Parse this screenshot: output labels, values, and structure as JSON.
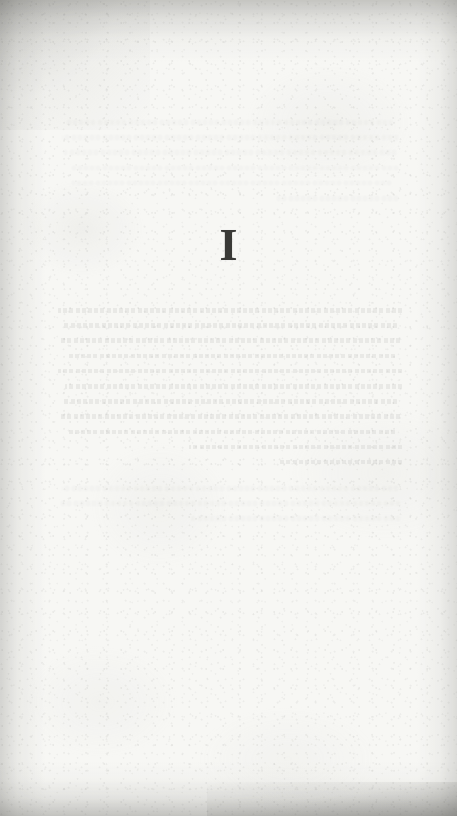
{
  "document": {
    "kind": "scanned-book-page",
    "page_type": "part-divider",
    "page_width": 457,
    "page_height": 816
  },
  "page": {
    "numeral": "I",
    "numeral_color": "#191917",
    "paper_color": "#f6f6f4",
    "edge_shadow_color": "#9a9a98"
  },
  "bleedthrough": {
    "visible": true,
    "description": "faint mirrored text showing through from the reverse side of the leaf",
    "line_count": 11,
    "lines": [
      {
        "width_class": "w-a"
      },
      {
        "width_class": "w-b"
      },
      {
        "width_class": "w-c"
      },
      {
        "width_class": "w-d"
      },
      {
        "width_class": "w-a"
      },
      {
        "width_class": "w-e"
      },
      {
        "width_class": "w-b"
      },
      {
        "width_class": "w-c"
      },
      {
        "width_class": "w-d"
      },
      {
        "width_class": "w-f"
      },
      {
        "width_class": "w-g"
      }
    ],
    "faint_top_lines": [
      {
        "width_class": "w-b"
      },
      {
        "width_class": "w-a"
      },
      {
        "width_class": "w-c"
      },
      {
        "width_class": "w-e"
      },
      {
        "width_class": "w-d"
      },
      {
        "width_class": "w-g"
      }
    ],
    "faint_bottom_lines": [
      {
        "width_class": "w-c"
      },
      {
        "width_class": "w-a"
      },
      {
        "width_class": "w-f"
      }
    ]
  }
}
